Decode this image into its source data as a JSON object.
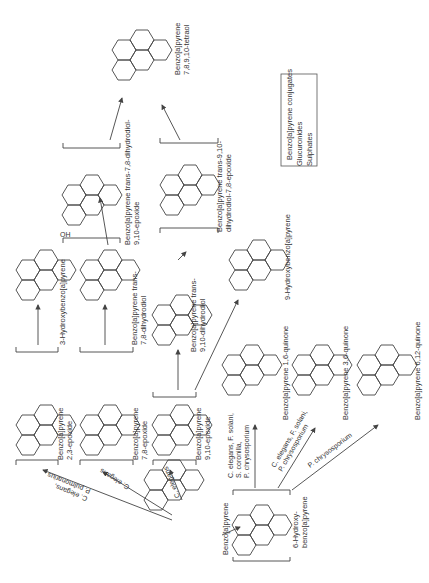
{
  "diagram": {
    "orientation": "rotated-90-clockwise",
    "compounds": {
      "parent": "Benzo[a]pyrene",
      "e23": [
        "Benzo[a]pyrene",
        "2,3-epoxide"
      ],
      "e78": [
        "Benzo[a]pyrene",
        "7,8-epoxide"
      ],
      "e910": [
        "Benzo[a]pyrene",
        "9,10-epoxide"
      ],
      "hydroxy3": "3-Hydroxybenzo[a]pyrene",
      "diol78": [
        "Benzo[a]pyrene trans-",
        "7,8-dihydrodiol"
      ],
      "diol910": [
        "Benzo[a]pyrene trans-",
        "9,10-dihydrodiol"
      ],
      "diolep78": [
        "Benzo[a]pyrene trans-7,8-dihydrodiol-",
        "9,10-epoxide"
      ],
      "diolep910": [
        "Benzo[a]pyrene trans-9,10-",
        "dihydrodiol-7,8-epoxide"
      ],
      "tetraol": [
        "Benzo[a]pyrene",
        "7,8,9,10-tetraol"
      ],
      "hydroxy9": "9-Hydroxybenzo[a]pyrene",
      "hydroxy6": [
        "6-Hydroxy-",
        "benzo[a]pyrene"
      ],
      "q16": "Benzo[a]pyrene 1,6-quinone",
      "q36": "Benzo[a]pyrene 3,6-quinone",
      "q612": "Benzo[a]pyrene 6,12-quinone",
      "conjugates": [
        "Benzo[a]pyrene conjugates",
        "Glucuronides",
        "Sulphates"
      ]
    },
    "organisms": {
      "to_e23": [
        "C. elegans,",
        "P. pulmonarius"
      ],
      "to_e78": "C. elegans",
      "to_e910": "C. elegans",
      "to_q16": [
        "C. elegans, F. solani,",
        "S. coronilla,",
        "P. chrysosporium"
      ],
      "to_q36": [
        "C. elegans, F. solani,",
        "P. chrysosporium"
      ],
      "to_q612": "P. chrysosporium"
    },
    "substituents": {
      "oh": "OH",
      "ho": "HO",
      "o": "O"
    }
  }
}
